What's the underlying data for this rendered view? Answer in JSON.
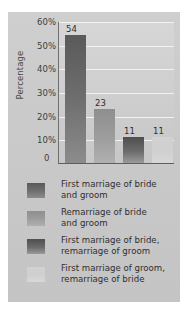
{
  "chart_data": {
    "type": "bar",
    "title": "",
    "xlabel": "",
    "ylabel": "Percentage",
    "ylim": [
      0,
      60
    ],
    "ytick_labels": [
      "60%",
      "50%",
      "40%",
      "30%",
      "20%",
      "10%"
    ],
    "ytick_values": [
      60,
      50,
      40,
      30,
      20,
      10
    ],
    "zero_label": "0",
    "grid": true,
    "legend_position": "below",
    "categories": [
      "First marriage of bride and groom",
      "Remarriage of bride and groom",
      "First marriage of bride, remarriage of groom",
      "First marriage of groom, remarriage of bride"
    ],
    "values": [
      54,
      23,
      11,
      11
    ],
    "value_labels": [
      "54",
      "23",
      "11",
      "11"
    ],
    "colors": [
      "#6e6e6e",
      "#9c9c9c",
      "#6b6b6b",
      "#d2d2d2"
    ]
  },
  "legend": {
    "items": [
      {
        "line1": "First marriage of bride",
        "line2": "and groom"
      },
      {
        "line1": "Remarriage of bride",
        "line2": "and groom"
      },
      {
        "line1": "First marriage of bride,",
        "line2": "remarriage of groom"
      },
      {
        "line1": "First marriage of groom,",
        "line2": "remarriage of bride"
      }
    ]
  }
}
